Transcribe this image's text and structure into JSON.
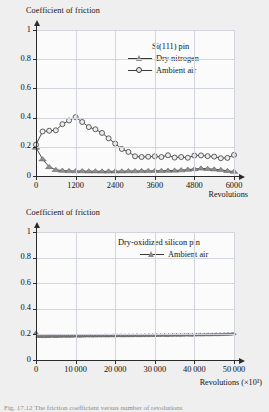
{
  "figure": {
    "background_color": "#efefef",
    "plot_background_color": "#fbfbfb",
    "grid_color": "#d2d6dc",
    "axis_color": "#2b2b2b",
    "series_line_color": "#3a3a3a",
    "triangle_color": "#8a8a8a",
    "caption_text": "Fig. 17.12  The friction coefficient versus number of revolutions"
  },
  "chart_data": [
    {
      "type": "line",
      "id": "top-chart",
      "title": "",
      "ylabel": "Coefficient of friction",
      "xlabel": "Revolutions",
      "xlim": [
        0,
        6000
      ],
      "ylim": [
        0,
        1
      ],
      "xticks": [
        0,
        1200,
        2400,
        3600,
        4800,
        6000
      ],
      "xtick_labels": [
        "0",
        "1200",
        "2400",
        "3600",
        "4800",
        "6000"
      ],
      "yticks": [
        0,
        0.2,
        0.4,
        0.6,
        0.8,
        1
      ],
      "ytick_labels": [
        "0",
        "0.2",
        "0.4",
        "0.6",
        "0.8",
        "1"
      ],
      "grid": true,
      "legend_position": "upper-right",
      "legend_title": "Si(111) pin",
      "series": [
        {
          "name": "Dry nitrogen",
          "marker": "triangle",
          "x": [
            0,
            200,
            400,
            600,
            800,
            1000,
            1200,
            1400,
            1600,
            1800,
            2000,
            2200,
            2400,
            2600,
            2800,
            3000,
            3200,
            3400,
            3600,
            3800,
            4000,
            4200,
            4400,
            4600,
            4800,
            5000,
            5200,
            5400,
            5600,
            5800,
            6000
          ],
          "values": [
            0.195,
            0.115,
            0.062,
            0.042,
            0.037,
            0.035,
            0.034,
            0.034,
            0.033,
            0.033,
            0.032,
            0.032,
            0.033,
            0.033,
            0.034,
            0.034,
            0.035,
            0.035,
            0.036,
            0.036,
            0.037,
            0.038,
            0.04,
            0.044,
            0.048,
            0.052,
            0.05,
            0.046,
            0.042,
            0.036,
            0.03
          ]
        },
        {
          "name": "Ambient air",
          "marker": "circle",
          "x": [
            0,
            200,
            400,
            600,
            800,
            1000,
            1200,
            1400,
            1600,
            1800,
            2000,
            2200,
            2400,
            2600,
            2800,
            3000,
            3200,
            3400,
            3600,
            3800,
            4000,
            4200,
            4400,
            4600,
            4800,
            5000,
            5200,
            5400,
            5600,
            5800,
            6000
          ],
          "values": [
            0.215,
            0.305,
            0.31,
            0.313,
            0.355,
            0.38,
            0.403,
            0.37,
            0.335,
            0.32,
            0.295,
            0.258,
            0.222,
            0.185,
            0.165,
            0.135,
            0.13,
            0.132,
            0.135,
            0.13,
            0.142,
            0.126,
            0.13,
            0.125,
            0.14,
            0.141,
            0.136,
            0.133,
            0.122,
            0.124,
            0.144
          ]
        }
      ]
    },
    {
      "type": "line",
      "id": "bottom-chart",
      "title": "",
      "ylabel": "Coefficient of friction",
      "xlabel": "Revolutions (×10³)",
      "xlim": [
        0,
        50000
      ],
      "ylim": [
        0,
        1
      ],
      "xticks": [
        0,
        10000,
        20000,
        30000,
        40000,
        50000
      ],
      "xtick_labels": [
        "0",
        "10 000",
        "20 000",
        "30 000",
        "40 000",
        "50 000"
      ],
      "yticks": [
        0,
        0.2,
        0.4,
        0.6,
        0.8,
        1
      ],
      "ytick_labels": [
        "0",
        "0.2",
        "0.4",
        "0.6",
        "0.8",
        "1"
      ],
      "grid": true,
      "legend_position": "upper-center",
      "legend_title": "Dry-oxidized silicon pin",
      "series": [
        {
          "name": "Ambient air",
          "marker": "triangle",
          "x": [
            0,
            500,
            1000,
            1500,
            2000,
            2500,
            3000,
            3500,
            4000,
            4500,
            5000,
            5500,
            6000,
            6500,
            7000,
            7500,
            8000,
            8500,
            9000,
            9500,
            10000,
            10500,
            11000,
            11500,
            12000,
            12500,
            13000,
            13500,
            14000,
            14500,
            15000,
            15500,
            16000,
            16500,
            17000,
            17500,
            18000,
            18500,
            19000,
            19500,
            20000,
            20500,
            21000,
            21500,
            22000,
            22500,
            23000,
            23500,
            24000,
            24500,
            25000,
            25500,
            26000,
            26500,
            27000,
            27500,
            28000,
            28500,
            29000,
            29500,
            30000,
            30500,
            31000,
            31500,
            32000,
            32500,
            33000,
            33500,
            34000,
            34500,
            35000,
            35500,
            36000,
            36500,
            37000,
            37500,
            38000,
            38500,
            39000,
            39500,
            40000,
            40500,
            41000,
            41500,
            42000,
            42500,
            43000,
            43500,
            44000,
            44500,
            45000,
            45500,
            46000,
            46500,
            47000,
            47500,
            48000,
            48500,
            49000,
            49500,
            50000
          ],
          "values": [
            0.215,
            0.186,
            0.184,
            0.188,
            0.183,
            0.187,
            0.184,
            0.188,
            0.185,
            0.189,
            0.184,
            0.188,
            0.185,
            0.189,
            0.186,
            0.19,
            0.185,
            0.189,
            0.186,
            0.19,
            0.187,
            0.191,
            0.186,
            0.19,
            0.187,
            0.191,
            0.188,
            0.192,
            0.187,
            0.191,
            0.188,
            0.192,
            0.188,
            0.192,
            0.189,
            0.193,
            0.188,
            0.192,
            0.189,
            0.193,
            0.189,
            0.193,
            0.19,
            0.194,
            0.189,
            0.193,
            0.19,
            0.194,
            0.19,
            0.194,
            0.191,
            0.195,
            0.19,
            0.194,
            0.191,
            0.195,
            0.191,
            0.196,
            0.191,
            0.195,
            0.192,
            0.196,
            0.192,
            0.196,
            0.193,
            0.197,
            0.192,
            0.196,
            0.193,
            0.197,
            0.194,
            0.198,
            0.193,
            0.197,
            0.194,
            0.198,
            0.195,
            0.199,
            0.194,
            0.198,
            0.195,
            0.199,
            0.196,
            0.2,
            0.196,
            0.2,
            0.197,
            0.201,
            0.197,
            0.201,
            0.198,
            0.202,
            0.198,
            0.202,
            0.199,
            0.203,
            0.2,
            0.204,
            0.201,
            0.205,
            0.206
          ]
        }
      ]
    }
  ]
}
